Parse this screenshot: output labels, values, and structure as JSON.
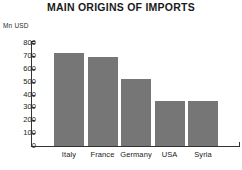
{
  "chart_data": {
    "type": "bar",
    "title": "MAIN ORIGINS OF IMPORTS",
    "xlabel": "",
    "ylabel": "Mn USD",
    "categories": [
      "Italy",
      "France",
      "Germany",
      "USA",
      "Syria"
    ],
    "values": [
      720,
      690,
      520,
      350,
      350
    ],
    "ylim": [
      0,
      800
    ],
    "yticks": [
      0,
      100,
      200,
      300,
      400,
      500,
      600,
      700,
      800
    ],
    "ytick_labels": [
      "0",
      "100",
      "200",
      "300",
      "400",
      "500",
      "600",
      "700",
      "800"
    ],
    "grid": false,
    "legend": null,
    "series": [
      {
        "name": "Imports",
        "values": [
          720,
          690,
          520,
          350,
          350
        ],
        "color": "#767676"
      }
    ],
    "axis_color": "#333333",
    "background": "#ffffff"
  }
}
